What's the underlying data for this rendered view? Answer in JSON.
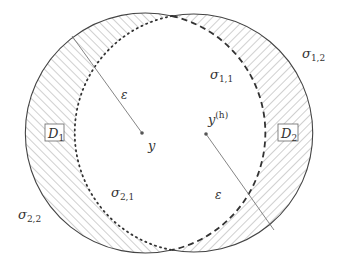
{
  "diagram": {
    "type": "two-overlapping-balls",
    "circles": [
      {
        "id": "ball-y",
        "center_label": "y",
        "cx": 142,
        "cy": 133,
        "r": 120
      },
      {
        "id": "ball-yh",
        "center_label": "y^(h)",
        "cx": 204,
        "cy": 134,
        "r": 119
      }
    ],
    "colors": {
      "stroke": "#444444",
      "hatch": "#8a8a8a",
      "radius_line": "#777777",
      "text": "#333333"
    },
    "labels": {
      "y": "y",
      "yh_base": "y",
      "yh_sup": "(h)",
      "eps_left": "ε",
      "eps_right": "ε",
      "D1_base": "D",
      "D1_sub": "1",
      "D2_base": "D",
      "D2_sub": "2",
      "sigma11_base": "σ",
      "sigma11_sub": "1,1",
      "sigma12_base": "σ",
      "sigma12_sub": "1,2",
      "sigma21_base": "σ",
      "sigma21_sub": "2,1",
      "sigma22_base": "σ",
      "sigma22_sub": "2,2"
    },
    "boundary_styles": {
      "sigma_1_1": "dashed",
      "sigma_1_2": "solid",
      "sigma_2_1": "dotted",
      "sigma_2_2": "solid"
    }
  }
}
